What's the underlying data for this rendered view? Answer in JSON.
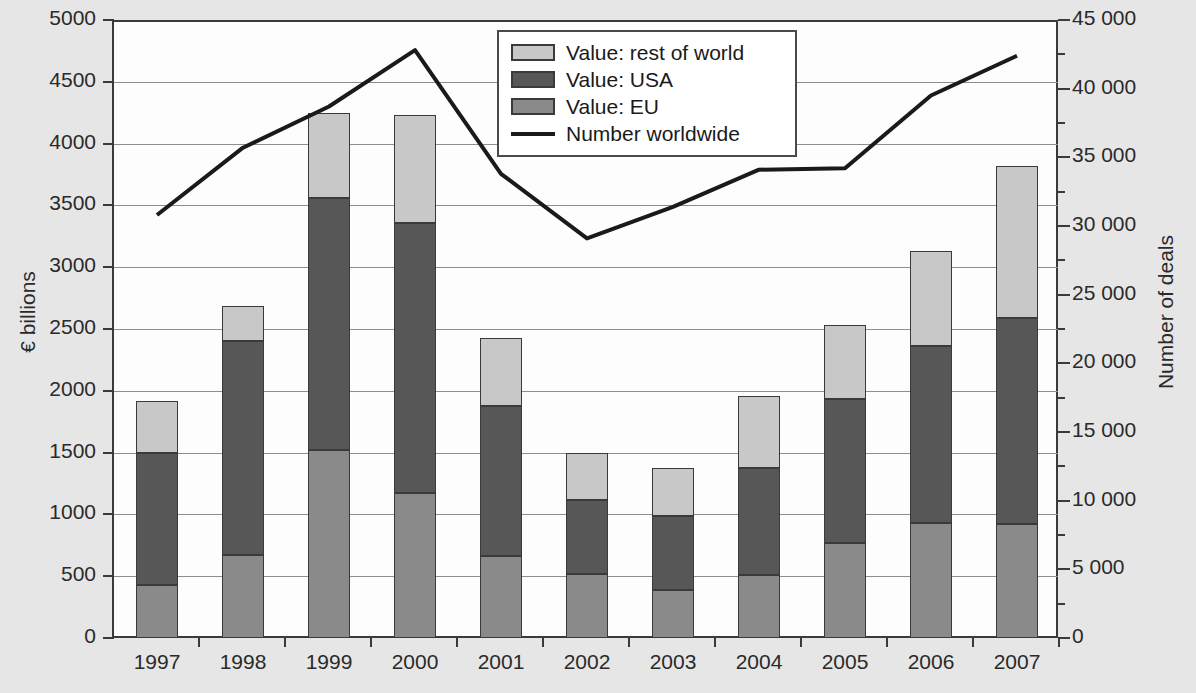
{
  "chart_data": {
    "type": "bar",
    "title": "",
    "categories": [
      "1997",
      "1998",
      "1999",
      "2000",
      "2001",
      "2002",
      "2003",
      "2004",
      "2005",
      "2006",
      "2007"
    ],
    "series": [
      {
        "name": "Value: EU",
        "values": [
          425,
          675,
          1520,
          1175,
          665,
          520,
          385,
          510,
          765,
          930,
          920
        ]
      },
      {
        "name": "Value: USA",
        "values": [
          1070,
          1725,
          2040,
          2185,
          1215,
          600,
          605,
          865,
          1165,
          1435,
          1670
        ]
      },
      {
        "name": "Value: rest of world",
        "values": [
          420,
          290,
          690,
          875,
          545,
          380,
          385,
          580,
          605,
          765,
          1230
        ]
      }
    ],
    "stacked_totals": [
      1915,
      2690,
      4250,
      4235,
      2425,
      1500,
      1375,
      1955,
      2535,
      3130,
      3820
    ],
    "line_series": {
      "name": "Number worldwide",
      "values": [
        30800,
        35700,
        38700,
        42800,
        33800,
        29100,
        31400,
        34100,
        34200,
        39500,
        42400
      ],
      "axis": "right"
    },
    "xlabel": "",
    "ylabel": "€ billions",
    "ylabel_right": "Number of deals",
    "ylim": [
      0,
      5000
    ],
    "ylim_right": [
      0,
      45000
    ],
    "yticks": [
      "0",
      "500",
      "1000",
      "1500",
      "2000",
      "2500",
      "3000",
      "3500",
      "4000",
      "4500",
      "5000"
    ],
    "yticks_right": [
      "0",
      "5 000",
      "10 000",
      "15 000",
      "20 000",
      "25 000",
      "30 000",
      "35 000",
      "40 000",
      "45 000"
    ],
    "grid": true,
    "legend_position": "top-center"
  },
  "legend": {
    "items": [
      {
        "label": "Value: rest of world",
        "marker": "swatch",
        "color": "#c8c8c8"
      },
      {
        "label": "Value: USA",
        "marker": "swatch",
        "color": "#575757"
      },
      {
        "label": "Value: EU",
        "marker": "swatch",
        "color": "#8a8a8a"
      },
      {
        "label": "Number worldwide",
        "marker": "line",
        "color": "#1a1a1a"
      }
    ]
  },
  "colors": {
    "rest_of_world": "#c8c8c8",
    "usa": "#575757",
    "eu": "#8a8a8a",
    "line": "#1a1a1a",
    "grid": "#8d8d8d",
    "axis": "#3a3a3a",
    "page_background": "#e6e6e6",
    "plot_background": "#fdfdfd"
  }
}
